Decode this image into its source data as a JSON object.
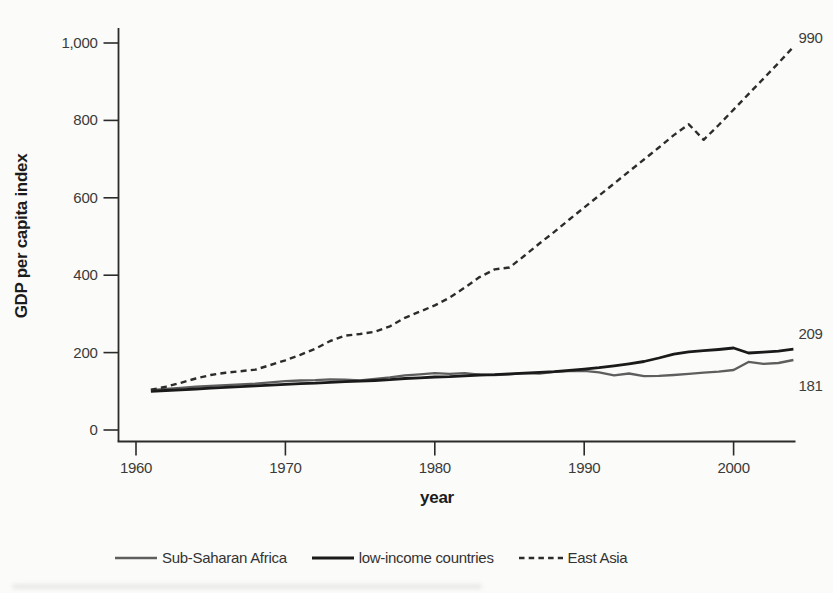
{
  "figure": {
    "background": "#fbfbf9",
    "ink": "#2b2b2b",
    "tick_text_color": "#3a3a3a"
  },
  "chart_data": {
    "type": "line",
    "title": "",
    "xlabel": "year",
    "ylabel": "GDP per capita index",
    "grid": false,
    "legend_position": "bottom",
    "xlim": [
      1958.8,
      2004.6
    ],
    "ylim": [
      0,
      1000
    ],
    "xticks": [
      1960,
      1970,
      1980,
      1990,
      2000
    ],
    "yticks": [
      0,
      200,
      400,
      600,
      800,
      1000
    ],
    "ytick_labels": [
      "0",
      "200",
      "400",
      "600",
      "800",
      "1,000"
    ],
    "x": [
      1961,
      1962,
      1963,
      1964,
      1965,
      1966,
      1967,
      1968,
      1969,
      1970,
      1971,
      1972,
      1973,
      1974,
      1975,
      1976,
      1977,
      1978,
      1979,
      1980,
      1981,
      1982,
      1983,
      1984,
      1985,
      1986,
      1987,
      1988,
      1989,
      1990,
      1991,
      1992,
      1993,
      1994,
      1995,
      1996,
      1997,
      1998,
      1999,
      2000,
      2001,
      2002,
      2003,
      2004
    ],
    "series": [
      {
        "name": "Sub-Saharan Africa",
        "line_style": "solid",
        "color": "#5e5e5e",
        "line_width": 2.3,
        "end_label": "181",
        "end_label_offset": [
          5,
          31
        ],
        "values": [
          103,
          106,
          109,
          112,
          114,
          116,
          118,
          120,
          123,
          126,
          128,
          129,
          131,
          130,
          128,
          132,
          136,
          141,
          144,
          147,
          145,
          147,
          143,
          142,
          144,
          147,
          146,
          150,
          152,
          153,
          149,
          141,
          146,
          139,
          140,
          142,
          145,
          148,
          151,
          155,
          176,
          171,
          173,
          181
        ]
      },
      {
        "name": "low-income countries",
        "line_style": "solid",
        "color": "#1a1a1a",
        "line_width": 2.8,
        "end_label": "209",
        "end_label_offset": [
          5,
          -10
        ],
        "values": [
          100,
          102,
          104,
          106,
          108,
          110,
          112,
          114,
          116,
          118,
          120,
          121,
          123,
          125,
          126,
          128,
          130,
          133,
          135,
          137,
          138,
          140,
          142,
          143,
          145,
          147,
          149,
          151,
          154,
          157,
          161,
          166,
          171,
          177,
          186,
          196,
          202,
          205,
          208,
          212,
          199,
          201,
          204,
          209
        ]
      },
      {
        "name": "East Asia",
        "line_style": "dashed",
        "color": "#2c2c2c",
        "line_width": 2.4,
        "end_label": "990",
        "end_label_offset": [
          5,
          -4
        ],
        "values": [
          104,
          112,
          122,
          133,
          142,
          148,
          152,
          156,
          168,
          180,
          194,
          210,
          230,
          244,
          248,
          254,
          268,
          290,
          306,
          322,
          342,
          368,
          395,
          415,
          420,
          450,
          482,
          512,
          544,
          575,
          606,
          637,
          668,
          699,
          730,
          762,
          790,
          750,
          788,
          828,
          868,
          908,
          948,
          990
        ]
      }
    ]
  }
}
